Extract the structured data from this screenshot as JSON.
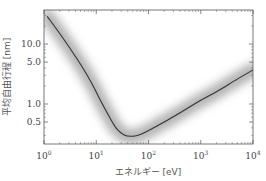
{
  "chart_data": {
    "type": "line",
    "title": "",
    "xlabel": "エネルギー [eV]",
    "ylabel": "平均自由行程 [nm]",
    "xscale": "log",
    "yscale": "log",
    "xlim": [
      1,
      10000
    ],
    "ylim": [
      0.215,
      37
    ],
    "grid": false,
    "legend": null,
    "x_ticks": [
      1,
      10,
      100,
      1000,
      10000
    ],
    "x_tick_labels": [
      "10^0",
      "10^1",
      "10^2",
      "10^3",
      "10^4"
    ],
    "y_ticks": [
      0.5,
      1.0,
      5.0,
      10.0
    ],
    "y_tick_labels": [
      "0.5",
      "1.0",
      "5.0",
      "10.0"
    ],
    "series": [
      {
        "name": "universal curve",
        "x": [
          1.15,
          2,
          3,
          5,
          8,
          12,
          18,
          25,
          35,
          50,
          70,
          100,
          200,
          500,
          1000,
          2000,
          5000,
          10000
        ],
        "values": [
          29,
          15,
          9,
          4.6,
          2.3,
          1.15,
          0.6,
          0.38,
          0.3,
          0.29,
          0.31,
          0.36,
          0.5,
          0.8,
          1.15,
          1.6,
          2.6,
          3.7
        ]
      }
    ],
    "annotations": [
      "gray uncertainty band surrounding curve"
    ]
  }
}
